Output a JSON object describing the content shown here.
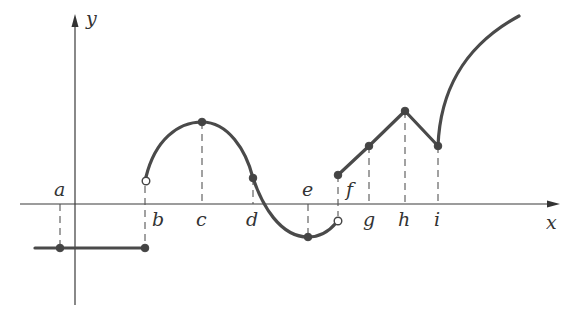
{
  "diagram": {
    "type": "piecewise-function-graph",
    "axes": {
      "x_label": "x",
      "y_label": "y"
    },
    "points": [
      {
        "name": "a",
        "label": "a"
      },
      {
        "name": "b",
        "label": "b"
      },
      {
        "name": "c",
        "label": "c"
      },
      {
        "name": "d",
        "label": "d"
      },
      {
        "name": "e",
        "label": "e"
      },
      {
        "name": "f",
        "label": "f"
      },
      {
        "name": "g",
        "label": "g"
      },
      {
        "name": "h",
        "label": "h"
      },
      {
        "name": "i",
        "label": "i"
      }
    ],
    "colors": {
      "curve": "#4a4a4a",
      "axis": "#3a3a3a",
      "background": "#ffffff"
    }
  }
}
